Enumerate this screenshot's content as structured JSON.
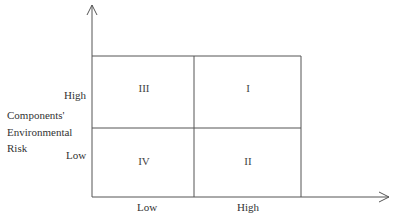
{
  "diagram": {
    "type": "2x2-matrix",
    "colors": {
      "line": "#555555",
      "text": "#333333",
      "background": "#ffffff"
    },
    "y_axis": {
      "title_lines": [
        "Components'",
        "Environmental",
        "Risk"
      ],
      "ticks": {
        "high": "High",
        "low": "Low"
      }
    },
    "x_axis": {
      "ticks": {
        "low": "Low",
        "high": "High"
      }
    },
    "quadrants": {
      "top_left": "III",
      "top_right": "I",
      "bottom_left": "IV",
      "bottom_right": "II"
    }
  }
}
